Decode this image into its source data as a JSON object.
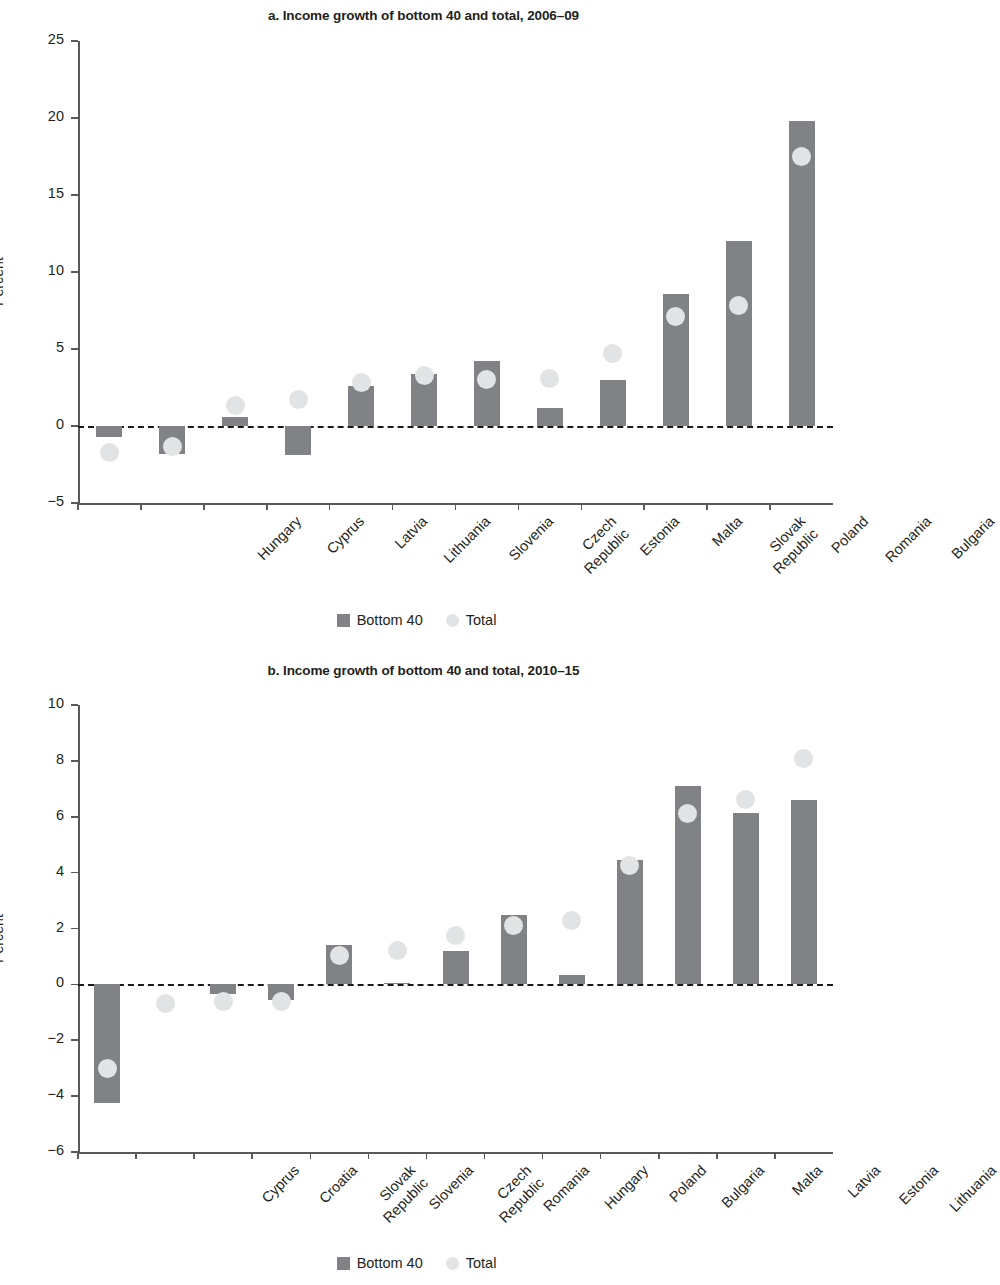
{
  "figure": {
    "legend_series_bar": "Bottom 40",
    "legend_series_dot": "Total",
    "colors": {
      "bar": "#808285",
      "dot": "#e2e3e4",
      "axis": "#58595b",
      "text": "#231f20",
      "zeroline": "#1a1a1a"
    }
  },
  "chart_data": [
    {
      "id": "panel-a",
      "type": "bar",
      "title": "a. Income growth of bottom 40 and total, 2006–09",
      "xlabel": "",
      "ylabel": "Percent",
      "ylim": [
        -5,
        25
      ],
      "yticks": [
        -5,
        0,
        5,
        10,
        15,
        20,
        25
      ],
      "ytick_labels": [
        "−5",
        "0",
        "5",
        "10",
        "15",
        "20",
        "25"
      ],
      "grid": false,
      "zero_reference_line": 0,
      "legend_position": "bottom-center",
      "categories": [
        "Hungary",
        "Cyprus",
        "Latvia",
        "Lithuania",
        "Slovenia",
        "Czech\nRepublic",
        "Estonia",
        "Malta",
        "Slovak\nRepublic",
        "Poland",
        "Romania",
        "Bulgaria"
      ],
      "series": [
        {
          "name": "Bottom 40",
          "marker": "bar",
          "values": [
            -0.7,
            -1.8,
            0.6,
            -1.9,
            2.6,
            3.4,
            4.2,
            1.2,
            3.0,
            8.6,
            12.0,
            19.8
          ]
        },
        {
          "name": "Total",
          "marker": "circle",
          "values": [
            -1.7,
            -1.3,
            1.3,
            1.7,
            2.8,
            3.3,
            3.0,
            3.1,
            4.7,
            7.1,
            7.8,
            17.5
          ]
        }
      ]
    },
    {
      "id": "panel-b",
      "type": "bar",
      "title": "b. Income growth of bottom 40 and total, 2010–15",
      "xlabel": "",
      "ylabel": "Percent",
      "ylim": [
        -6,
        10
      ],
      "yticks": [
        -6,
        -4,
        -2,
        0,
        2,
        4,
        6,
        8,
        10
      ],
      "ytick_labels": [
        "−6",
        "−4",
        "−2",
        "0",
        "2",
        "4",
        "6",
        "8",
        "10"
      ],
      "grid": false,
      "zero_reference_line": 0,
      "legend_position": "bottom-center",
      "categories": [
        "Cyprus",
        "Croatia",
        "Slovak\nRepublic",
        "Slovenia",
        "Czech\nRepublic",
        "Romania",
        "Hungary",
        "Poland",
        "Bulgaria",
        "Malta",
        "Latvia",
        "Estonia",
        "Lithuania"
      ],
      "series": [
        {
          "name": "Bottom 40",
          "marker": "bar",
          "values": [
            -4.25,
            0.0,
            -0.35,
            -0.55,
            1.4,
            0.05,
            1.2,
            2.5,
            0.35,
            4.45,
            7.1,
            6.15,
            6.6
          ]
        },
        {
          "name": "Total",
          "marker": "circle",
          "values": [
            -3.0,
            -0.7,
            -0.6,
            -0.6,
            1.05,
            1.2,
            1.75,
            2.1,
            2.3,
            4.25,
            6.1,
            6.6,
            8.1
          ]
        }
      ]
    }
  ]
}
